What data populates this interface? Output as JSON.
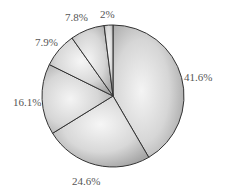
{
  "chart_data": {
    "type": "pie",
    "title": "",
    "start_angle_deg": 0,
    "direction": "clockwise",
    "slices": [
      {
        "label": "41.6%",
        "value": 41.6
      },
      {
        "label": "24.6%",
        "value": 24.6
      },
      {
        "label": "16.1%",
        "value": 16.1
      },
      {
        "label": "7.9%",
        "value": 7.9
      },
      {
        "label": "7.8%",
        "value": 7.8
      },
      {
        "label": "2%",
        "value": 2.0
      }
    ],
    "values": [
      41.6,
      24.6,
      16.1,
      7.9,
      7.8,
      2.0
    ],
    "categories": [
      "41.6%",
      "24.6%",
      "16.1%",
      "7.9%",
      "7.8%",
      "2%"
    ],
    "legend": "none",
    "fill": "grayscale radial gradient",
    "stroke_color": "#333333"
  },
  "labels": {
    "s0": "41.6%",
    "s1": "24.6%",
    "s2": "16.1%",
    "s3": "7.9%",
    "s4": "7.8%",
    "s5": "2%"
  }
}
